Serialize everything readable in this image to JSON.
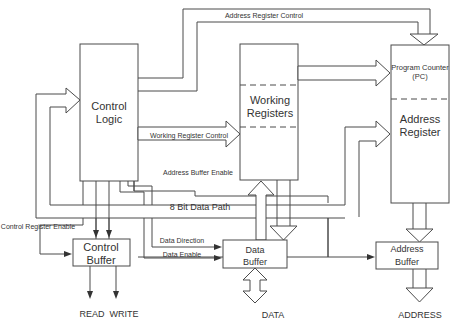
{
  "diagram": {
    "blocks": {
      "control_logic": {
        "line1": "Control",
        "line2": "Logic"
      },
      "working_registers": {
        "line1": "Working",
        "line2": "Registers"
      },
      "program_counter": {
        "line1": "Program Counter",
        "line2": "(PC)"
      },
      "address_register": {
        "line1": "Address",
        "line2": "Register"
      },
      "control_buffer": {
        "line1": "Control",
        "line2": "Buffer"
      },
      "data_buffer": {
        "line1": "Data",
        "line2": "Buffer"
      },
      "address_buffer": {
        "line1": "Address",
        "line2": "Buffer"
      }
    },
    "signals": {
      "address_register_control": "Address Register Control",
      "working_register_control": "Working Register Control",
      "address_buffer_enable": "Address Buffer Enable",
      "data_path": "8 Bit Data Path",
      "control_register_enable": "Control Register Enable",
      "data_direction": "Data Direction",
      "data_enable": "Data Enable"
    },
    "outputs": {
      "read": "READ",
      "write": "WRITE",
      "data": "DATA",
      "address": "ADDRESS"
    },
    "colors": {
      "line": "#4a4a4a",
      "text": "#333333",
      "background": "#ffffff"
    }
  }
}
